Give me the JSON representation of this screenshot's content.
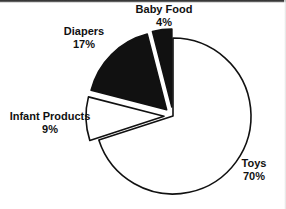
{
  "chart_data": {
    "type": "pie",
    "title": "",
    "subtitle": "",
    "xlabel": "",
    "ylabel": "",
    "legend_position": "none",
    "grid": false,
    "value_unit": "percent",
    "categories": [
      "Toys",
      "Diapers",
      "Infant Products",
      "Baby Food"
    ],
    "values": [
      70,
      17,
      9,
      4
    ],
    "series": [
      {
        "name": "Share of sales",
        "values": [
          70,
          17,
          9,
          4
        ]
      }
    ],
    "slices": [
      {
        "label": "Toys",
        "value": 70,
        "value_text": "70%",
        "fill": "#ffffff",
        "stroke": "#111111",
        "exploded": false,
        "start_angle_deg": 0,
        "sweep_deg": 252
      },
      {
        "label": "Infant Products",
        "value": 9,
        "value_text": "9%",
        "fill": "#ffffff",
        "stroke": "#111111",
        "exploded": true,
        "start_angle_deg": 252,
        "sweep_deg": 32.4
      },
      {
        "label": "Diapers",
        "value": 17,
        "value_text": "17%",
        "fill": "#111111",
        "stroke": "#111111",
        "exploded": true,
        "start_angle_deg": 284.4,
        "sweep_deg": 61.2
      },
      {
        "label": "Baby Food",
        "value": 4,
        "value_text": "4%",
        "fill": "#111111",
        "stroke": "#111111",
        "exploded": true,
        "start_angle_deg": 345.6,
        "sweep_deg": 14.4
      }
    ]
  },
  "labels": {
    "baby_food": {
      "name": "Baby Food",
      "value": "4%"
    },
    "diapers": {
      "name": "Diapers",
      "value": "17%"
    },
    "infant_products": {
      "name": "Infant Products",
      "value": "9%"
    },
    "toys": {
      "name": "Toys",
      "value": "70%"
    }
  },
  "colors": {
    "slice_dark": "#111111",
    "slice_light": "#ffffff",
    "outline": "#111111",
    "text": "#111111",
    "background": "#ffffff"
  }
}
